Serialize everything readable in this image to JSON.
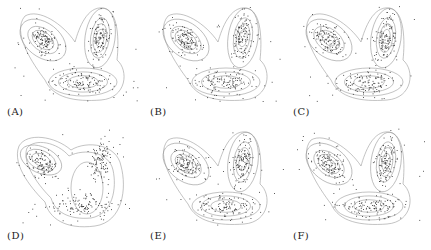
{
  "figure": {
    "panels": [
      {
        "id": "A",
        "label": "(A)",
        "left": 5,
        "top": 2,
        "shape": "v"
      },
      {
        "id": "B",
        "label": "(B)",
        "left": 148,
        "top": 2,
        "shape": "v"
      },
      {
        "id": "C",
        "label": "(C)",
        "left": 291,
        "top": 2,
        "shape": "v"
      },
      {
        "id": "D",
        "label": "(D)",
        "left": 5,
        "top": 126,
        "shape": "blob"
      },
      {
        "id": "E",
        "label": "(E)",
        "left": 148,
        "top": 126,
        "shape": "v"
      },
      {
        "id": "F",
        "label": "(F)",
        "left": 291,
        "top": 126,
        "shape": "v"
      }
    ],
    "colors": {
      "points": "#333333",
      "contours": "#9a9a9a",
      "text": "#222222"
    }
  },
  "chart_data": [
    {
      "type": "scatter",
      "title": "(A)",
      "description": "Scatter of samples with density contour lines; three clusters (upper-left, upper-right, bottom) forming a V shape",
      "clusters": [
        {
          "cx": 0.3,
          "cy": 0.35
        },
        {
          "cx": 0.72,
          "cy": 0.32
        },
        {
          "cx": 0.55,
          "cy": 0.78
        }
      ],
      "axes": "none"
    },
    {
      "type": "scatter",
      "title": "(B)",
      "description": "Same dataset with estimated density contours, V shape",
      "clusters": [
        {
          "cx": 0.3,
          "cy": 0.35
        },
        {
          "cx": 0.72,
          "cy": 0.32
        },
        {
          "cx": 0.55,
          "cy": 0.78
        }
      ],
      "axes": "none"
    },
    {
      "type": "scatter",
      "title": "(C)",
      "description": "Same dataset with estimated density contours, V shape",
      "clusters": [
        {
          "cx": 0.3,
          "cy": 0.35
        },
        {
          "cx": 0.72,
          "cy": 0.32
        },
        {
          "cx": 0.55,
          "cy": 0.78
        }
      ],
      "axes": "none"
    },
    {
      "type": "scatter",
      "title": "(D)",
      "description": "Same dataset with smoother contours merging right and bottom clusters into one blob",
      "clusters": [
        {
          "cx": 0.3,
          "cy": 0.35
        },
        {
          "cx": 0.72,
          "cy": 0.32
        },
        {
          "cx": 0.55,
          "cy": 0.78
        }
      ],
      "axes": "none"
    },
    {
      "type": "scatter",
      "title": "(E)",
      "description": "Same dataset with estimated density contours, V shape",
      "clusters": [
        {
          "cx": 0.3,
          "cy": 0.35
        },
        {
          "cx": 0.72,
          "cy": 0.32
        },
        {
          "cx": 0.55,
          "cy": 0.78
        }
      ],
      "axes": "none"
    },
    {
      "type": "scatter",
      "title": "(F)",
      "description": "Same dataset with estimated density contours, V shape",
      "clusters": [
        {
          "cx": 0.3,
          "cy": 0.35
        },
        {
          "cx": 0.72,
          "cy": 0.32
        },
        {
          "cx": 0.55,
          "cy": 0.78
        }
      ],
      "axes": "none"
    }
  ]
}
